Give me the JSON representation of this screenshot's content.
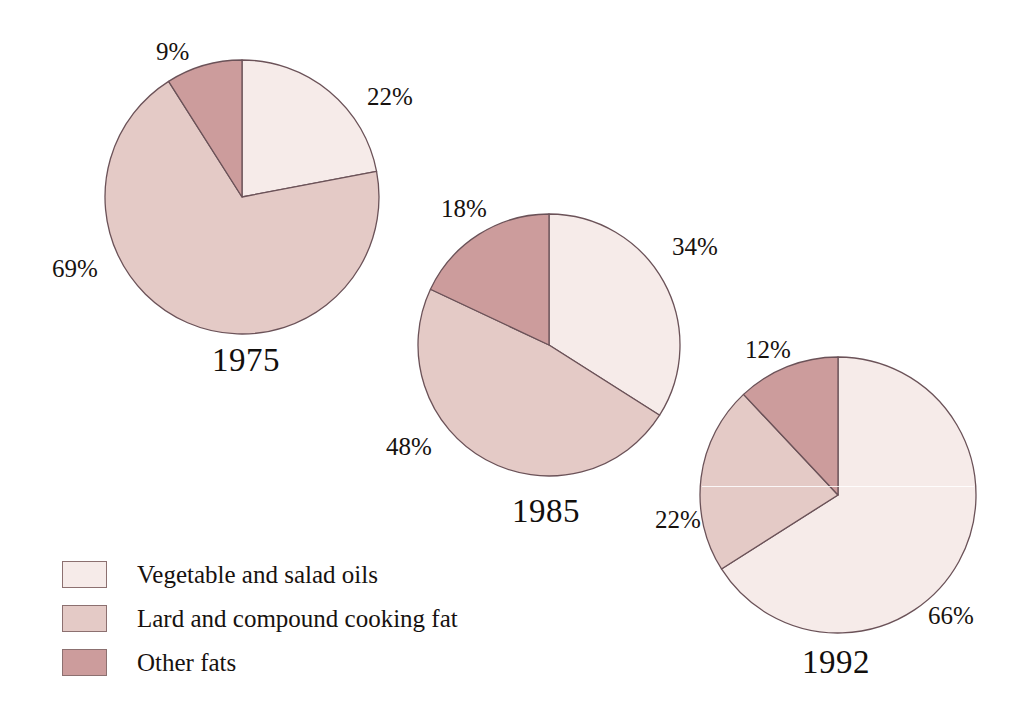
{
  "figure": {
    "background_color": "#ffffff",
    "outline_color": "#6b5258"
  },
  "legend": {
    "position": "bottom-left",
    "items": [
      {
        "label": "Vegetable and salad oils",
        "color": "#f6ebe9",
        "key": "vegetable-and-salad-oils"
      },
      {
        "label": "Lard and compound cooking fat",
        "color": "#e4cac6",
        "key": "lard-and-compound-cooking-fat"
      },
      {
        "label": "Other fats",
        "color": "#cc9c9c",
        "key": "other-fats"
      }
    ]
  },
  "pies": [
    {
      "year": "1975",
      "cx": 242,
      "cy": 197,
      "r": 137,
      "year_label_x": 212,
      "year_label_y": 344,
      "slices": [
        {
          "name": "Vegetable and salad oils",
          "value": 22,
          "label": "22%",
          "color": "#f6ebe9",
          "lx": 367,
          "ly": 84
        },
        {
          "name": "Lard and compound cooking fat",
          "value": 69,
          "label": "69%",
          "color": "#e4cac6",
          "lx": 52,
          "ly": 256
        },
        {
          "name": "Other fats",
          "value": 9,
          "label": "9%",
          "color": "#cc9c9c",
          "lx": 156,
          "ly": 39
        }
      ]
    },
    {
      "year": "1985",
      "cx": 549,
      "cy": 345,
      "r": 131,
      "year_label_x": 512,
      "year_label_y": 495,
      "slices": [
        {
          "name": "Vegetable and salad oils",
          "value": 34,
          "label": "34%",
          "color": "#f6ebe9",
          "lx": 672,
          "ly": 234
        },
        {
          "name": "Lard and compound cooking fat",
          "value": 48,
          "label": "48%",
          "color": "#e4cac6",
          "lx": 386,
          "ly": 434
        },
        {
          "name": "Other fats",
          "value": 18,
          "label": "18%",
          "color": "#cc9c9c",
          "lx": 441,
          "ly": 196
        }
      ]
    },
    {
      "year": "1992",
      "cx": 838,
      "cy": 495,
      "r": 138,
      "year_label_x": 802,
      "year_label_y": 646,
      "slices": [
        {
          "name": "Vegetable and salad oils",
          "value": 66,
          "label": "66%",
          "color": "#f6ebe9",
          "lx": 928,
          "ly": 603
        },
        {
          "name": "Lard and compound cooking fat",
          "value": 22,
          "label": "22%",
          "color": "#e4cac6",
          "lx": 655,
          "ly": 507
        },
        {
          "name": "Other fats",
          "value": 12,
          "label": "12%",
          "color": "#cc9c9c",
          "lx": 745,
          "ly": 337
        }
      ]
    }
  ],
  "chart_data": {
    "type": "pie",
    "title": "",
    "subtitle": "",
    "xlabel": "",
    "ylabel": "",
    "grid": false,
    "legend_position": "bottom-left",
    "units": "percent",
    "categories": [
      "Vegetable and salad oils",
      "Lard and compound cooking fat",
      "Other fats"
    ],
    "category_colors": [
      "#f6ebe9",
      "#e4cac6",
      "#cc9c9c"
    ],
    "panels": [
      {
        "label": "1975",
        "values": [
          22,
          69,
          9
        ],
        "value_labels": [
          "22%",
          "69%",
          "9%"
        ]
      },
      {
        "label": "1985",
        "values": [
          34,
          48,
          18
        ],
        "value_labels": [
          "34%",
          "48%",
          "18%"
        ]
      },
      {
        "label": "1992",
        "values": [
          66,
          22,
          12
        ],
        "value_labels": [
          "66%",
          "22%",
          "12%"
        ]
      }
    ]
  }
}
